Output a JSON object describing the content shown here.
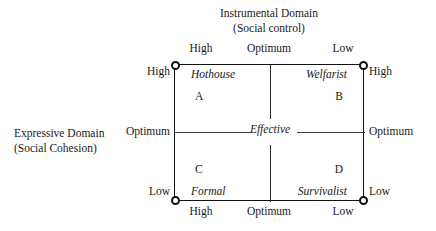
{
  "figure": {
    "top_axis_title": {
      "line1": "Instrumental Domain",
      "line2": "(Social control)"
    },
    "left_axis_title": {
      "line1": "Expressive Domain",
      "line2": "(Social Cohesion)"
    },
    "center_label": "Effective",
    "top_ticks": {
      "left": "High",
      "middle": "Optimum",
      "right": "Low"
    },
    "bottom_ticks": {
      "left": "High",
      "middle": "Optimum",
      "right": "Low"
    },
    "left_ticks": {
      "top": "High",
      "middle": "Optimum",
      "bottom": "Low"
    },
    "right_ticks": {
      "top": "High",
      "middle": "Optimum",
      "bottom": "Low"
    },
    "quadrants": {
      "top_left": {
        "letter": "A",
        "label": "Hothouse"
      },
      "top_right": {
        "letter": "B",
        "label": "Welfarist"
      },
      "bottom_left": {
        "letter": "C",
        "label": "Formal"
      },
      "bottom_right": {
        "letter": "D",
        "label": "Survivalist"
      }
    },
    "colors": {
      "background": "#ffffff",
      "frame": "#111111",
      "text": "#1a1a1a",
      "divider": "#2b2b2b"
    }
  }
}
